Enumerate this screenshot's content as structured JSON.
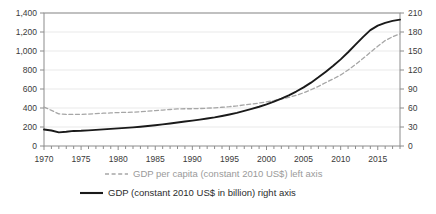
{
  "chart_data": {
    "type": "line",
    "title": "",
    "xlabel": "",
    "grid": "horizontal",
    "legend_position": "bottom",
    "x": [
      1970,
      1971,
      1972,
      1973,
      1974,
      1975,
      1976,
      1977,
      1978,
      1979,
      1980,
      1981,
      1982,
      1983,
      1984,
      1985,
      1986,
      1987,
      1988,
      1989,
      1990,
      1991,
      1992,
      1993,
      1994,
      1995,
      1996,
      1997,
      1998,
      1999,
      2000,
      2001,
      2002,
      2003,
      2004,
      2005,
      2006,
      2007,
      2008,
      2009,
      2010,
      2011,
      2012,
      2013,
      2014,
      2015,
      2016,
      2017,
      2018
    ],
    "xlim": [
      1970,
      2018
    ],
    "xticks": [
      1970,
      1975,
      1980,
      1985,
      1990,
      1995,
      2000,
      2005,
      2010,
      2015
    ],
    "xtick_labels": [
      "1970",
      "1975",
      "1980",
      "1985",
      "1990",
      "1995",
      "2000",
      "2005",
      "2010",
      "2015"
    ],
    "x_minor_tick_interval": 1,
    "left_axis": {
      "label": "",
      "ylim": [
        0,
        1400
      ],
      "yticks": [
        0,
        200,
        400,
        600,
        800,
        1000,
        1200,
        1400
      ],
      "ytick_labels": [
        "0",
        "200",
        "400",
        "600",
        "800",
        "1,000",
        "1,200",
        "1,400"
      ]
    },
    "right_axis": {
      "label": "",
      "ylim": [
        0,
        210
      ],
      "yticks": [
        0,
        30,
        60,
        90,
        120,
        150,
        180,
        210
      ],
      "ytick_labels": [
        "0",
        "30",
        "60",
        "90",
        "120",
        "150",
        "180",
        "210"
      ]
    },
    "series": [
      {
        "name": "GDP per capita (constant 2010 US$) left axis",
        "axis": "left",
        "style": "dashed",
        "color": "#a6a6a6",
        "values": [
          410,
          375,
          338,
          332,
          334,
          333,
          336,
          341,
          345,
          348,
          352,
          354,
          356,
          360,
          366,
          372,
          378,
          384,
          390,
          392,
          392,
          394,
          398,
          402,
          408,
          414,
          422,
          432,
          442,
          452,
          464,
          478,
          494,
          512,
          534,
          560,
          592,
          628,
          668,
          706,
          748,
          800,
          858,
          920,
          986,
          1050,
          1110,
          1150,
          1180
        ]
      },
      {
        "name": "GDP (constant 2010 US$ in billion) right axis",
        "axis": "right",
        "style": "solid",
        "color": "#1a1a1a",
        "values": [
          26.0,
          24.5,
          21.5,
          22.5,
          23.8,
          24.0,
          24.6,
          25.4,
          26.2,
          27.0,
          27.8,
          28.6,
          29.4,
          30.4,
          31.6,
          32.8,
          34.2,
          35.6,
          37.2,
          38.6,
          40.0,
          41.6,
          43.4,
          45.2,
          47.4,
          49.8,
          52.4,
          55.4,
          58.6,
          62.0,
          65.8,
          70.0,
          74.8,
          80.0,
          86.0,
          92.6,
          100.0,
          108.4,
          117.4,
          126.6,
          136.8,
          148.0,
          160.0,
          172.0,
          183.0,
          190.0,
          194.5,
          197.5,
          199.5
        ]
      }
    ]
  },
  "legend": {
    "items": [
      {
        "label": "GDP per capita (constant 2010 US$) left axis",
        "marker": "dashed-line-marker"
      },
      {
        "label": "GDP (constant 2010 US$ in billion) right axis",
        "marker": "solid-line-marker"
      }
    ]
  }
}
